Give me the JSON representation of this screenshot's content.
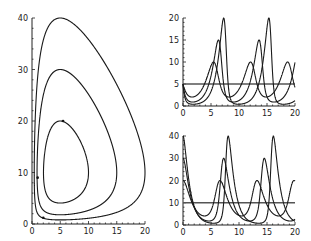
{
  "chart_data": [
    {
      "id": "phase",
      "type": "line",
      "title": "",
      "xlabel": "",
      "ylabel": "",
      "xlim": [
        0,
        20
      ],
      "ylim": [
        0,
        40
      ],
      "xticks": [
        "0",
        "5",
        "10",
        "15",
        "20"
      ],
      "yticks": [
        "0",
        "10",
        "20",
        "30",
        "40"
      ],
      "grid": false,
      "description": "Phase portrait: three closed orbits around equilibrium (5, 10)",
      "series": [
        {
          "name": "orbit-inner",
          "initial": [
            5,
            20
          ],
          "x_range": [
            2,
            10
          ],
          "y_range": [
            4,
            20
          ]
        },
        {
          "name": "orbit-middle",
          "initial": [
            5,
            30
          ],
          "x_range": [
            1,
            15
          ],
          "y_range": [
            1.7,
            30
          ]
        },
        {
          "name": "orbit-outer",
          "initial": [
            5,
            40
          ],
          "x_range": [
            0.5,
            20
          ],
          "y_range": [
            1,
            40
          ]
        }
      ],
      "markers": [
        [
          5.5,
          20
        ],
        [
          1,
          9
        ],
        [
          2,
          1.2
        ]
      ]
    },
    {
      "id": "prey",
      "type": "line",
      "title": "",
      "xlim": [
        0,
        20
      ],
      "ylim": [
        0,
        20
      ],
      "xticks": [
        "0",
        "5",
        "10",
        "15",
        "20"
      ],
      "yticks": [
        "0",
        "5",
        "10",
        "15",
        "20"
      ],
      "grid": false,
      "hline": 5,
      "series": [
        {
          "name": "x(t) inner",
          "peak": 10,
          "peaks_at": [
            1.1,
            7.8,
            14.5
          ]
        },
        {
          "name": "x(t) middle",
          "peak": 15,
          "peaks_at": [
            0.8,
            8.2,
            15.5
          ]
        },
        {
          "name": "x(t) outer",
          "peak": 20,
          "peaks_at": [
            0.6,
            8.9,
            16.8
          ]
        }
      ]
    },
    {
      "id": "predator",
      "type": "line",
      "title": "",
      "xlim": [
        0,
        20
      ],
      "ylim": [
        0,
        40
      ],
      "xticks": [
        "0",
        "5",
        "10",
        "15",
        "20"
      ],
      "yticks": [
        "0",
        "10",
        "20",
        "30",
        "40"
      ],
      "grid": false,
      "hline": 10,
      "series": [
        {
          "name": "y(t) inner",
          "peak": 20,
          "peaks_at": [
            0,
            6.6,
            13.2,
            20
          ]
        },
        {
          "name": "y(t) middle",
          "peak": 30,
          "peaks_at": [
            0,
            7.2,
            14.5
          ]
        },
        {
          "name": "y(t) outer",
          "peak": 40,
          "peaks_at": [
            0,
            8.0,
            16.0
          ]
        }
      ]
    }
  ],
  "model": {
    "alpha": 1.0,
    "beta": 0.1,
    "gamma": 1.0,
    "delta": 0.2,
    "t_max": 20
  }
}
